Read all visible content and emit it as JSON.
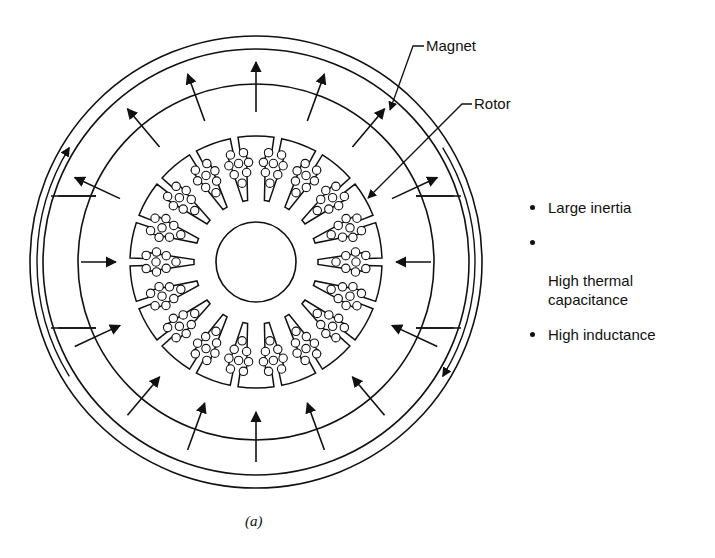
{
  "labels": {
    "magnet": "Magnet",
    "rotor": "Rotor"
  },
  "bullets": [
    {
      "text": "Large inertia"
    },
    {
      "text": "High thermal\ncapacitance"
    },
    {
      "text": "High inductance"
    }
  ],
  "caption": "(a)",
  "geometry": {
    "center": [
      256,
      262
    ],
    "housing_outer_radius": 226,
    "housing_inner_radius": 213,
    "magnet_inner_radius": 178,
    "rotor_outer_radius": 126,
    "shaft_radius": 40,
    "rotor_slots": 18,
    "radial_arrows": 16
  },
  "colors": {
    "line": "#111111",
    "background": "#ffffff"
  }
}
